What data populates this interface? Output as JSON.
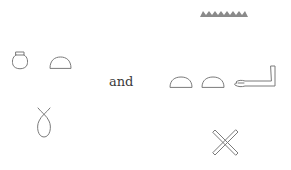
{
  "diagram": {
    "type": "hieroglyph-comparison",
    "left_group": {
      "top_row": [
        {
          "glyph": "pot-icon",
          "description": "nw pot"
        },
        {
          "glyph": "bread-loaf-icon",
          "description": "t bread bun"
        }
      ],
      "bottom": {
        "glyph": "wick-loop-icon",
        "description": "h twisted flax/wick loop"
      }
    },
    "connector": "and",
    "right_group": {
      "top": {
        "glyph": "water-ripple-icon",
        "description": "n water zigzag"
      },
      "middle_row": [
        {
          "glyph": "bread-loaf-icon",
          "description": "t bread bun"
        },
        {
          "glyph": "bread-loaf-icon",
          "description": "t bread bun"
        },
        {
          "glyph": "arm-icon",
          "description": "a forearm"
        }
      ],
      "bottom": {
        "glyph": "crossed-sticks-icon",
        "description": "crossed sticks"
      }
    },
    "colors": {
      "glyph_stroke": "#7a7a7a",
      "text": "#3a3a3a",
      "background": "#ffffff"
    }
  }
}
